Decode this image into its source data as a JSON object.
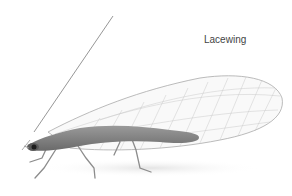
{
  "image": {
    "subject": "lacewing insect",
    "label": "Lacewing",
    "colors": {
      "background": "#ffffff",
      "body": "#7a7a7a",
      "wing_vein": "#b5b5b5",
      "label_text": "#444444"
    }
  }
}
